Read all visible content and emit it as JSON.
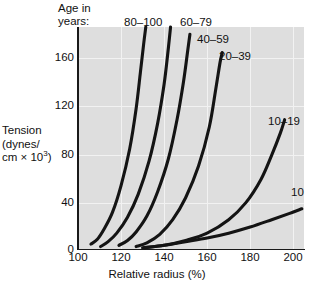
{
  "chart_data": {
    "type": "line",
    "title": "",
    "xlabel": "Relative radius (%)",
    "ylabel": "Tension (dynes/cm × 10³)",
    "ylabel_line1": "Tension",
    "ylabel_line2": "(dynes/",
    "ylabel_line3_pre": "cm × 10",
    "ylabel_line3_sup": "3",
    "ylabel_line3_post": ")",
    "legend_title_line1": "Age in",
    "legend_title_line2": "years:",
    "legend_position": "inline-curve-labels",
    "grid": true,
    "xlim": [
      100,
      205
    ],
    "ylim": [
      0,
      182
    ],
    "xticks": [
      100,
      120,
      140,
      160,
      180,
      200
    ],
    "yticks": [
      0,
      40,
      80,
      120,
      160
    ],
    "xtick_labels": [
      "100",
      "120",
      "140",
      "160",
      "180",
      "200"
    ],
    "ytick_labels": [
      "0",
      "40",
      "80",
      "120",
      "160"
    ],
    "series": [
      {
        "name": "80–100",
        "label": "80–100",
        "x": [
          106,
          109,
          112,
          116,
          120,
          124,
          127,
          129,
          130.5,
          131.5
        ],
        "y": [
          4,
          8,
          16,
          30,
          52,
          82,
          115,
          145,
          168,
          182
        ]
      },
      {
        "name": "60–79",
        "label": "60–79",
        "x": [
          110.5,
          114,
          118,
          123,
          128,
          133,
          137,
          140,
          142,
          143
        ],
        "y": [
          2,
          6,
          13,
          26,
          45,
          72,
          103,
          135,
          165,
          182
        ]
      },
      {
        "name": "40–59",
        "label": "40–59",
        "x": [
          119,
          123,
          127,
          132,
          137,
          142,
          146,
          149,
          151,
          152
        ],
        "y": [
          3,
          7,
          14,
          27,
          47,
          74,
          106,
          137,
          163,
          176
        ]
      },
      {
        "name": "20–39",
        "label": "20–39",
        "x": [
          127,
          132,
          138,
          144,
          150,
          156,
          161,
          164,
          166,
          167
        ],
        "y": [
          2,
          5,
          12,
          24,
          42,
          68,
          100,
          131,
          153,
          161
        ]
      },
      {
        "name": "10–19",
        "label": "10–19",
        "x": [
          130,
          140,
          150,
          160,
          170,
          178,
          185,
          190,
          194,
          196
        ],
        "y": [
          1,
          3,
          7,
          13,
          24,
          38,
          57,
          77,
          95,
          106
        ]
      },
      {
        "name": "10",
        "label": "10",
        "x": [
          131,
          140,
          150,
          160,
          170,
          180,
          190,
          198,
          204
        ],
        "y": [
          1,
          3,
          6,
          9,
          13,
          18,
          24,
          29,
          33
        ]
      }
    ],
    "annotations": [
      {
        "text": "80–100",
        "target_series": "80–100"
      },
      {
        "text": "60–79",
        "target_series": "60–79"
      },
      {
        "text": "40–59",
        "target_series": "40–59"
      },
      {
        "text": "20–39",
        "target_series": "20–39"
      },
      {
        "text": "10–19",
        "target_series": "10–19"
      },
      {
        "text": "10",
        "target_series": "10"
      }
    ],
    "colors": {
      "plot_background": "#dedede",
      "grid": "#f2f2f2",
      "axis": "#1a1a1a",
      "curve": "#141414",
      "page_background": "#ffffff",
      "text": "#111111"
    }
  }
}
